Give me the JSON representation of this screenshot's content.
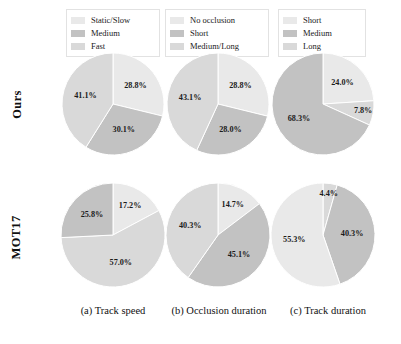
{
  "figure": {
    "row_labels": [
      {
        "id": "ours",
        "text": "Ours"
      },
      {
        "id": "mot17",
        "text": "MOT17"
      }
    ],
    "captions": [
      {
        "id": "a",
        "text": "(a) Track speed"
      },
      {
        "id": "b",
        "text": "(b) Occlusion duration"
      },
      {
        "id": "c",
        "text": "(c) Track duration"
      }
    ]
  },
  "colors": {
    "light": "#e9e9e9",
    "dark": "#c2c2c2",
    "medium": "#d9d9d9",
    "edge": "#ffffff",
    "legend_border": "#e2e2e2"
  },
  "legends": {
    "a": {
      "items": [
        {
          "label": "Static/Slow",
          "color": "#e9e9e9"
        },
        {
          "label": "Medium",
          "color": "#c2c2c2"
        },
        {
          "label": "Fast",
          "color": "#d9d9d9"
        }
      ]
    },
    "b": {
      "items": [
        {
          "label": "No occlusion",
          "color": "#e9e9e9"
        },
        {
          "label": "Short",
          "color": "#c2c2c2"
        },
        {
          "label": "Medium/Long",
          "color": "#d9d9d9"
        }
      ]
    },
    "c": {
      "items": [
        {
          "label": "Short",
          "color": "#e9e9e9"
        },
        {
          "label": "Medium",
          "color": "#c2c2c2"
        },
        {
          "label": "Long",
          "color": "#d9d9d9"
        }
      ]
    }
  },
  "chart_data": [
    {
      "type": "pie",
      "id": "ours-track-speed",
      "title": "(a) Track speed",
      "row": "Ours",
      "startangle_deg": 90,
      "direction": "clockwise",
      "categories": [
        "Static/Slow",
        "Medium",
        "Fast"
      ],
      "values": [
        28.8,
        30.1,
        41.1
      ],
      "labels": [
        "28.8%",
        "30.1%",
        "41.1%"
      ],
      "colors": [
        "#e9e9e9",
        "#c2c2c2",
        "#d9d9d9"
      ],
      "legend_position": "top"
    },
    {
      "type": "pie",
      "id": "ours-occlusion-duration",
      "title": "(b) Occlusion duration",
      "row": "Ours",
      "startangle_deg": 90,
      "direction": "clockwise",
      "categories": [
        "No occlusion",
        "Short",
        "Medium/Long"
      ],
      "values": [
        28.8,
        28.0,
        43.1
      ],
      "labels": [
        "28.8%",
        "28.0%",
        "43.1%"
      ],
      "colors": [
        "#e9e9e9",
        "#c2c2c2",
        "#d9d9d9"
      ],
      "legend_position": "top"
    },
    {
      "type": "pie",
      "id": "ours-track-duration",
      "title": "(c) Track duration",
      "row": "Ours",
      "startangle_deg": 90,
      "direction": "clockwise",
      "categories": [
        "Short",
        "Medium",
        "Long"
      ],
      "values": [
        24.0,
        7.8,
        68.3
      ],
      "labels": [
        "24.0%",
        "7.8%",
        "68.3%"
      ],
      "colors": [
        "#e9e9e9",
        "#d9d9d9",
        "#c2c2c2"
      ],
      "legend_position": "top"
    },
    {
      "type": "pie",
      "id": "mot17-track-speed",
      "title": "(a) Track speed",
      "row": "MOT17",
      "startangle_deg": 90,
      "direction": "clockwise",
      "categories": [
        "Static/Slow",
        "Fast",
        "Medium"
      ],
      "values": [
        17.2,
        57.0,
        25.8
      ],
      "labels": [
        "17.2%",
        "57.0%",
        "25.8%"
      ],
      "colors": [
        "#e9e9e9",
        "#d9d9d9",
        "#c2c2c2"
      ],
      "legend_position": "top"
    },
    {
      "type": "pie",
      "id": "mot17-occlusion-duration",
      "title": "(b) Occlusion duration",
      "row": "MOT17",
      "startangle_deg": 90,
      "direction": "clockwise",
      "categories": [
        "No occlusion",
        "Short",
        "Medium/Long"
      ],
      "values": [
        14.7,
        45.1,
        40.3
      ],
      "labels": [
        "14.7%",
        "45.1%",
        "40.3%"
      ],
      "colors": [
        "#e9e9e9",
        "#c2c2c2",
        "#d9d9d9"
      ],
      "legend_position": "top"
    },
    {
      "type": "pie",
      "id": "mot17-track-duration",
      "title": "(c) Track duration",
      "row": "MOT17",
      "startangle_deg": 90,
      "direction": "clockwise",
      "categories": [
        "Long",
        "Medium",
        "Short"
      ],
      "values": [
        4.4,
        40.3,
        55.3
      ],
      "labels": [
        "4.4%",
        "40.3%",
        "55.3%"
      ],
      "colors": [
        "#d9d9d9",
        "#c2c2c2",
        "#e9e9e9"
      ],
      "legend_position": "top"
    }
  ]
}
